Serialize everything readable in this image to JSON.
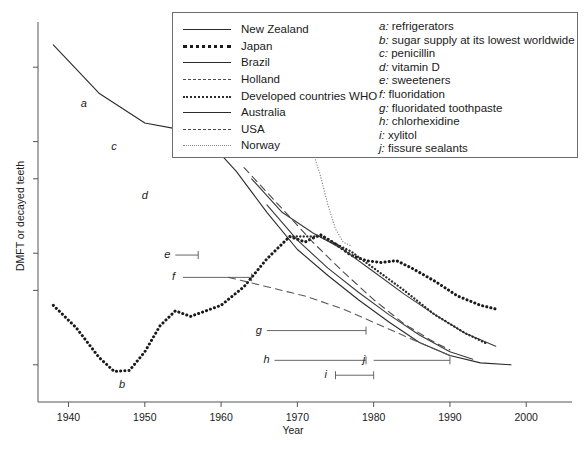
{
  "chart_data": {
    "type": "line",
    "title": "",
    "xlabel": "Year",
    "ylabel": "DMFT or decayed teeth",
    "xlim": [
      1936,
      2006
    ],
    "ylim": [
      0,
      10
    ],
    "xticks": [
      1940,
      1950,
      1960,
      1970,
      1980,
      1990,
      2000
    ],
    "xticklabels": [
      "1940",
      "1950",
      "1960",
      "1970",
      "1980",
      "1990",
      "2000"
    ],
    "yticks": [
      1,
      3,
      4,
      6,
      7,
      9
    ],
    "yticklabels": [
      "",
      "",
      "",
      "",
      "",
      ""
    ],
    "grid": false,
    "legend_position": "top-center",
    "series": [
      {
        "name": "New Zealand",
        "style": "solid",
        "color": "#2b2b2b",
        "points": [
          [
            1938,
            9.6
          ],
          [
            1944,
            8.3
          ],
          [
            1950,
            7.5
          ],
          [
            1954,
            7.35
          ],
          [
            1958,
            7.1
          ],
          [
            1962,
            6.2
          ],
          [
            1966,
            5.1
          ],
          [
            1970,
            4.1
          ],
          [
            1974,
            3.4
          ],
          [
            1978,
            2.75
          ],
          [
            1982,
            2.15
          ],
          [
            1986,
            1.6
          ],
          [
            1990,
            1.25
          ],
          [
            1994,
            1.05
          ],
          [
            1998,
            1.0
          ]
        ]
      },
      {
        "name": "Japan",
        "style": "dotted-bold",
        "color": "#1a1a1a",
        "points": [
          [
            1938,
            2.6
          ],
          [
            1941,
            2.0
          ],
          [
            1944,
            1.2
          ],
          [
            1946,
            0.82
          ],
          [
            1948,
            0.85
          ],
          [
            1950,
            1.35
          ],
          [
            1952,
            2.05
          ],
          [
            1954,
            2.45
          ],
          [
            1956,
            2.3
          ],
          [
            1958,
            2.45
          ],
          [
            1960,
            2.6
          ],
          [
            1963,
            3.1
          ],
          [
            1966,
            3.85
          ],
          [
            1969,
            4.45
          ],
          [
            1971,
            4.3
          ],
          [
            1973,
            4.5
          ],
          [
            1975,
            4.25
          ],
          [
            1977,
            3.95
          ],
          [
            1979,
            3.8
          ],
          [
            1981,
            3.75
          ],
          [
            1983,
            3.8
          ],
          [
            1985,
            3.6
          ],
          [
            1988,
            3.25
          ],
          [
            1991,
            2.85
          ],
          [
            1994,
            2.6
          ],
          [
            1996,
            2.5
          ]
        ]
      },
      {
        "name": "Brazil",
        "style": "solid",
        "color": "#3a3a3a",
        "points": [
          [
            1964,
            6.0
          ],
          [
            1968,
            5.1
          ],
          [
            1972,
            4.55
          ],
          [
            1976,
            4.1
          ],
          [
            1980,
            3.5
          ],
          [
            1984,
            2.9
          ],
          [
            1988,
            2.35
          ],
          [
            1992,
            1.85
          ],
          [
            1996,
            1.5
          ]
        ]
      },
      {
        "name": "Holland",
        "style": "dashed",
        "color": "#4a4a4a",
        "points": [
          [
            1963,
            6.3
          ],
          [
            1968,
            5.2
          ],
          [
            1972,
            4.3
          ],
          [
            1976,
            3.5
          ],
          [
            1980,
            2.75
          ],
          [
            1984,
            2.1
          ],
          [
            1988,
            1.6
          ],
          [
            1990,
            1.4
          ]
        ]
      },
      {
        "name": "Developed countries WHO",
        "style": "dotted-med",
        "color": "#2b2b2b",
        "points": [
          [
            1969,
            4.45
          ],
          [
            1973,
            4.45
          ],
          [
            1977,
            4.05
          ],
          [
            1980,
            3.6
          ],
          [
            1984,
            3.0
          ],
          [
            1988,
            2.35
          ],
          [
            1992,
            1.85
          ],
          [
            1995,
            1.55
          ]
        ]
      },
      {
        "name": "Australia",
        "style": "solid",
        "color": "#3a3a3a",
        "points": [
          [
            1966,
            5.3
          ],
          [
            1970,
            4.35
          ],
          [
            1974,
            3.6
          ],
          [
            1978,
            2.95
          ],
          [
            1982,
            2.35
          ],
          [
            1986,
            1.8
          ],
          [
            1990,
            1.35
          ],
          [
            1993,
            1.15
          ]
        ]
      },
      {
        "name": "USA",
        "style": "dashed",
        "color": "#5a5a5a",
        "points": [
          [
            1961,
            3.35
          ],
          [
            1966,
            3.1
          ],
          [
            1971,
            2.85
          ],
          [
            1976,
            2.5
          ],
          [
            1981,
            2.05
          ],
          [
            1986,
            1.6
          ],
          [
            1990,
            1.25
          ]
        ]
      },
      {
        "name": "Norway",
        "style": "dotted-fine",
        "color": "#8a8a8a",
        "points": [
          [
            1968,
            7.3
          ],
          [
            1970,
            6.9
          ],
          [
            1971,
            7.0
          ],
          [
            1972,
            6.75
          ],
          [
            1973,
            6.1
          ],
          [
            1974,
            5.3
          ],
          [
            1975,
            4.65
          ],
          [
            1976,
            4.3
          ],
          [
            1977,
            4.2
          ]
        ]
      }
    ],
    "annotation_markers": [
      {
        "letter": "a",
        "type": "label",
        "x": 1942,
        "y": 8.0
      },
      {
        "letter": "b",
        "type": "label",
        "x": 1947,
        "y": 0.45
      },
      {
        "letter": "c",
        "type": "label",
        "x": 1946,
        "y": 6.85
      },
      {
        "letter": "d",
        "type": "label",
        "x": 1950,
        "y": 5.55
      },
      {
        "letter": "e",
        "type": "span",
        "x_start": 1954,
        "x_end": 1957,
        "y": 3.95
      },
      {
        "letter": "f",
        "type": "span",
        "x_start": 1955,
        "x_end": 1964,
        "y": 3.35
      },
      {
        "letter": "g",
        "type": "span",
        "x_start": 1966,
        "x_end": 1979,
        "y": 1.92
      },
      {
        "letter": "h",
        "type": "span",
        "x_start": 1967,
        "x_end": 1979,
        "y": 1.12
      },
      {
        "letter": "i",
        "type": "span",
        "x_start": 1975,
        "x_end": 1980,
        "y": 0.72
      },
      {
        "letter": "j",
        "type": "span",
        "x_start": 1980,
        "x_end": 1990,
        "y": 1.12
      }
    ]
  },
  "legend": {
    "items": [
      {
        "label": "New Zealand",
        "style": "solid"
      },
      {
        "label": "Japan",
        "style": "dotted-bold"
      },
      {
        "label": "Brazil",
        "style": "solid"
      },
      {
        "label": "Holland",
        "style": "dashed"
      },
      {
        "label": "Developed countries WHO",
        "style": "dotted-med"
      },
      {
        "label": "Australia",
        "style": "solid"
      },
      {
        "label": "USA",
        "style": "dashed"
      },
      {
        "label": "Norway",
        "style": "dotted-fine"
      }
    ]
  },
  "notes": {
    "items": [
      {
        "key": "a:",
        "text": " refrigerators"
      },
      {
        "key": "b:",
        "text": " sugar supply at its lowest worldwide"
      },
      {
        "key": "c:",
        "text": " penicillin"
      },
      {
        "key": "d:",
        "text": " vitamin D"
      },
      {
        "key": "e:",
        "text": " sweeteners"
      },
      {
        "key": "f:",
        "text": " fluoridation"
      },
      {
        "key": "g:",
        "text": " fluoridated toothpaste"
      },
      {
        "key": "h:",
        "text": " chlorhexidine"
      },
      {
        "key": "i:",
        "text": " xylitol"
      },
      {
        "key": "j:",
        "text": " fissure sealants"
      }
    ]
  }
}
